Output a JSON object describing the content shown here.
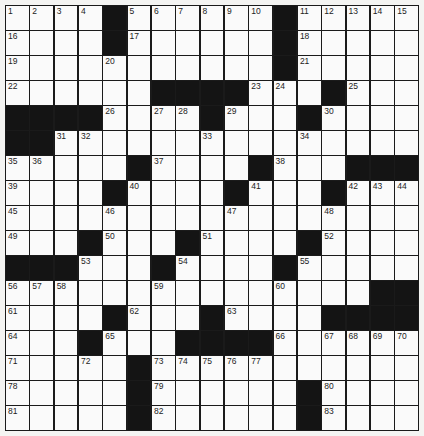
{
  "puzzle": {
    "rows": 17,
    "cols": 17,
    "colors": {
      "black": "#141414",
      "white": "#fafafa",
      "line": "#1a1a1a"
    },
    "layout": [
      "....#......#.....",
      "....#......#.....",
      "...........#.....",
      "......####...#...",
      "####....#...#....",
      "##...............",
      ".....#....#...###",
      "....#....#...#...",
      ".................",
      "...#...#....#....",
      "###...#....#.....",
      "...............##",
      "....#...#....####",
      "...#...####......",
      ".....#...........",
      ".....#......#....",
      ".....#......#...."
    ],
    "numbers": [
      [
        0,
        0,
        1
      ],
      [
        0,
        1,
        2
      ],
      [
        0,
        2,
        3
      ],
      [
        0,
        3,
        4
      ],
      [
        0,
        5,
        5
      ],
      [
        0,
        6,
        6
      ],
      [
        0,
        7,
        7
      ],
      [
        0,
        8,
        8
      ],
      [
        0,
        9,
        9
      ],
      [
        0,
        10,
        10
      ],
      [
        0,
        12,
        11
      ],
      [
        0,
        13,
        12
      ],
      [
        0,
        14,
        13
      ],
      [
        0,
        15,
        14
      ],
      [
        0,
        16,
        15
      ],
      [
        1,
        0,
        16
      ],
      [
        1,
        5,
        17
      ],
      [
        1,
        12,
        18
      ],
      [
        2,
        0,
        19
      ],
      [
        2,
        4,
        20
      ],
      [
        2,
        12,
        21
      ],
      [
        3,
        0,
        22
      ],
      [
        3,
        10,
        23
      ],
      [
        3,
        11,
        24
      ],
      [
        3,
        14,
        25
      ],
      [
        4,
        4,
        26
      ],
      [
        4,
        6,
        27
      ],
      [
        4,
        7,
        28
      ],
      [
        4,
        9,
        29
      ],
      [
        4,
        13,
        30
      ],
      [
        5,
        2,
        31
      ],
      [
        5,
        3,
        32
      ],
      [
        5,
        8,
        33
      ],
      [
        5,
        12,
        34
      ],
      [
        6,
        0,
        35
      ],
      [
        6,
        1,
        36
      ],
      [
        6,
        6,
        37
      ],
      [
        6,
        11,
        38
      ],
      [
        7,
        0,
        39
      ],
      [
        7,
        5,
        40
      ],
      [
        7,
        10,
        41
      ],
      [
        7,
        14,
        42
      ],
      [
        7,
        15,
        43
      ],
      [
        7,
        16,
        44
      ],
      [
        8,
        0,
        45
      ],
      [
        8,
        4,
        46
      ],
      [
        8,
        9,
        47
      ],
      [
        8,
        13,
        48
      ],
      [
        9,
        0,
        49
      ],
      [
        9,
        4,
        50
      ],
      [
        9,
        8,
        51
      ],
      [
        9,
        13,
        52
      ],
      [
        10,
        3,
        53
      ],
      [
        10,
        7,
        54
      ],
      [
        10,
        12,
        55
      ],
      [
        11,
        0,
        56
      ],
      [
        11,
        1,
        57
      ],
      [
        11,
        2,
        58
      ],
      [
        11,
        6,
        59
      ],
      [
        11,
        11,
        60
      ],
      [
        12,
        0,
        61
      ],
      [
        12,
        5,
        62
      ],
      [
        12,
        9,
        63
      ],
      [
        13,
        0,
        64
      ],
      [
        13,
        4,
        65
      ],
      [
        13,
        11,
        66
      ],
      [
        13,
        13,
        67
      ],
      [
        13,
        14,
        68
      ],
      [
        13,
        15,
        69
      ],
      [
        13,
        16,
        70
      ],
      [
        14,
        0,
        71
      ],
      [
        14,
        3,
        72
      ],
      [
        14,
        6,
        73
      ],
      [
        14,
        7,
        74
      ],
      [
        14,
        8,
        75
      ],
      [
        14,
        9,
        76
      ],
      [
        14,
        10,
        77
      ],
      [
        15,
        0,
        78
      ],
      [
        15,
        6,
        79
      ],
      [
        15,
        13,
        80
      ],
      [
        16,
        0,
        81
      ],
      [
        16,
        6,
        82
      ],
      [
        16,
        13,
        83
      ]
    ]
  }
}
